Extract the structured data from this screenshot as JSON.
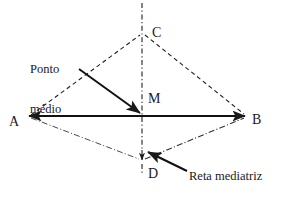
{
  "figure": {
    "type": "geometry-diagram",
    "title_text": "",
    "background_color": "#ffffff",
    "ink_color": "#1a1a1a",
    "light_ink_color": "#555555"
  },
  "points": {
    "A": {
      "label": "A",
      "x": 28,
      "y": 116,
      "label_x": 9,
      "label_y": 115
    },
    "B": {
      "label": "B",
      "x": 246,
      "y": 116,
      "label_x": 252,
      "label_y": 113
    },
    "C": {
      "label": "C",
      "x": 142,
      "y": 33,
      "label_x": 152,
      "label_y": 26
    },
    "D": {
      "label": "D",
      "x": 142,
      "y": 160,
      "label_x": 148,
      "label_y": 167
    },
    "M": {
      "label": "M",
      "x": 142,
      "y": 116,
      "label_x": 148,
      "label_y": 92
    }
  },
  "annotations": {
    "ponto_medio": {
      "line1": "Ponto",
      "line2": "médio",
      "x": 30,
      "y": 37,
      "arrow_from": {
        "x": 79,
        "y": 69
      },
      "arrow_to": {
        "x": 141,
        "y": 114
      }
    },
    "reta_mediatriz": {
      "text": "Reta mediatriz",
      "x": 189,
      "y": 170,
      "arrow_from": {
        "x": 186,
        "y": 171
      },
      "arrow_to": {
        "x": 146,
        "y": 151
      }
    }
  },
  "segments": [
    {
      "name": "segment-AB",
      "style": "solid",
      "from": "A",
      "to": "B",
      "double_arrow": true
    },
    {
      "name": "segment-AC",
      "style": "dashed",
      "from": "A",
      "to": "C",
      "double_arrow": false
    },
    {
      "name": "segment-CB",
      "style": "dashed",
      "from": "C",
      "to": "B",
      "double_arrow": false
    },
    {
      "name": "segment-AD",
      "style": "dash-dot",
      "from": "A",
      "to": "D",
      "double_arrow": false
    },
    {
      "name": "segment-DB",
      "style": "dash-dot",
      "from": "D",
      "to": "B",
      "double_arrow": false
    },
    {
      "name": "perpendicular-bisector",
      "style": "dash-dot",
      "from": "top",
      "to": "bottom",
      "double_arrow": false
    }
  ]
}
